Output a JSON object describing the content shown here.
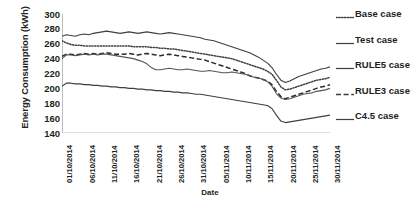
{
  "chart_data": {
    "type": "line",
    "title": "",
    "xlabel": "Date",
    "ylabel": "Energy Consumption (kWh)",
    "ylim": [
      140,
      300
    ],
    "yticks": [
      140,
      160,
      180,
      200,
      220,
      240,
      260,
      280,
      300
    ],
    "grid": false,
    "legend_position": "right",
    "x": [
      "01/10/2014",
      "02/10/2014",
      "03/10/2014",
      "04/10/2014",
      "05/10/2014",
      "06/10/2014",
      "07/10/2014",
      "08/10/2014",
      "09/10/2014",
      "10/10/2014",
      "11/10/2014",
      "12/10/2014",
      "13/10/2014",
      "14/10/2014",
      "15/10/2014",
      "16/10/2014",
      "17/10/2014",
      "18/10/2014",
      "19/10/2014",
      "20/10/2014",
      "21/10/2014",
      "22/10/2014",
      "23/10/2014",
      "24/10/2014",
      "25/10/2014",
      "26/10/2014",
      "27/10/2014",
      "28/10/2014",
      "29/10/2014",
      "30/10/2014",
      "31/10/2014",
      "01/11/2014",
      "02/11/2014",
      "03/11/2014",
      "04/11/2014",
      "05/11/2014",
      "06/11/2014",
      "07/11/2014",
      "08/11/2014",
      "09/11/2014",
      "10/11/2014",
      "11/11/2014",
      "12/11/2014",
      "13/11/2014",
      "14/11/2014",
      "15/11/2014",
      "16/11/2014",
      "17/11/2014",
      "18/11/2014",
      "19/11/2014",
      "20/11/2014",
      "21/11/2014",
      "22/11/2014",
      "23/11/2014",
      "24/11/2014",
      "25/11/2014",
      "26/11/2014",
      "27/11/2014",
      "28/11/2014",
      "29/11/2014",
      "30/11/2014"
    ],
    "xticks": [
      "01/10/2014",
      "06/10/2014",
      "11/10/2014",
      "16/10/2014",
      "21/10/2014",
      "26/10/2014",
      "31/10/2014",
      "05/11/2014",
      "10/11/2014",
      "15/11/2014",
      "20/11/2014",
      "25/11/2014",
      "30/11/2014"
    ],
    "series": [
      {
        "name": "Test case",
        "style": "solid",
        "color": "#3f3f3f",
        "values": [
          270,
          272,
          271,
          270,
          272,
          273,
          272,
          274,
          275,
          276,
          277,
          276,
          275,
          274,
          275,
          276,
          275,
          274,
          275,
          276,
          275,
          274,
          273,
          274,
          275,
          274,
          273,
          272,
          271,
          270,
          269,
          268,
          266,
          265,
          264,
          262,
          260,
          258,
          256,
          254,
          252,
          250,
          248,
          245,
          242,
          238,
          234,
          228,
          219,
          211,
          208,
          210,
          213,
          216,
          218,
          220,
          222,
          224,
          226,
          227,
          229
        ]
      },
      {
        "name": "Base case",
        "style": "dotted",
        "color": "#3f3f3f",
        "values": [
          264,
          261,
          259,
          258,
          258,
          257,
          257,
          257,
          257,
          257,
          257,
          257,
          257,
          257,
          257,
          257,
          256,
          256,
          256,
          256,
          255,
          255,
          254,
          254,
          253,
          253,
          252,
          251,
          250,
          249,
          248,
          247,
          246,
          245,
          244,
          243,
          242,
          241,
          240,
          238,
          236,
          234,
          232,
          230,
          228,
          226,
          223,
          219,
          211,
          202,
          198,
          199,
          201,
          203,
          205,
          207,
          209,
          211,
          212,
          213,
          215
        ]
      },
      {
        "name": "RULE3 case",
        "style": "dashed",
        "color": "#2b2b2b",
        "values": [
          243,
          246,
          246,
          245,
          246,
          247,
          246,
          247,
          246,
          247,
          248,
          247,
          246,
          246,
          246,
          247,
          246,
          245,
          246,
          247,
          246,
          245,
          244,
          245,
          246,
          245,
          244,
          243,
          242,
          241,
          240,
          239,
          238,
          236,
          234,
          232,
          230,
          228,
          226,
          224,
          222,
          220,
          217,
          215,
          214,
          212,
          210,
          205,
          196,
          189,
          186,
          188,
          190,
          192,
          194,
          196,
          198,
          200,
          202,
          203,
          205
        ]
      },
      {
        "name": "RULE5 case",
        "style": "solid",
        "color": "#555555",
        "values": [
          240,
          245,
          245,
          244,
          245,
          246,
          245,
          246,
          245,
          246,
          246,
          245,
          244,
          243,
          242,
          241,
          240,
          238,
          236,
          233,
          228,
          225,
          225,
          226,
          227,
          226,
          225,
          225,
          226,
          225,
          224,
          223,
          223,
          224,
          223,
          222,
          221,
          221,
          222,
          221,
          220,
          219,
          217,
          215,
          214,
          212,
          209,
          203,
          193,
          187,
          185,
          186,
          188,
          190,
          192,
          193,
          194,
          196,
          197,
          198,
          200
        ]
      },
      {
        "name": "C4.5 case",
        "style": "solid",
        "color": "#3f3f3f",
        "values": [
          203,
          207,
          207,
          206,
          206,
          205,
          205,
          204,
          204,
          203,
          203,
          202,
          202,
          201,
          201,
          200,
          200,
          199,
          199,
          198,
          198,
          197,
          197,
          196,
          196,
          195,
          195,
          194,
          194,
          193,
          192,
          192,
          191,
          190,
          189,
          188,
          187,
          186,
          185,
          184,
          183,
          182,
          181,
          180,
          179,
          178,
          177,
          173,
          164,
          156,
          154,
          155,
          156,
          157,
          158,
          159,
          160,
          161,
          162,
          163,
          164
        ]
      }
    ]
  },
  "legend": {
    "items": [
      {
        "label": "Base case",
        "style": "dotted"
      },
      {
        "label": "Test case",
        "style": "solid"
      },
      {
        "label": "RULE5 case",
        "style": "solid"
      },
      {
        "label": "RULE3 case",
        "style": "dashed"
      },
      {
        "label": "C4.5 case",
        "style": "solid"
      }
    ]
  }
}
